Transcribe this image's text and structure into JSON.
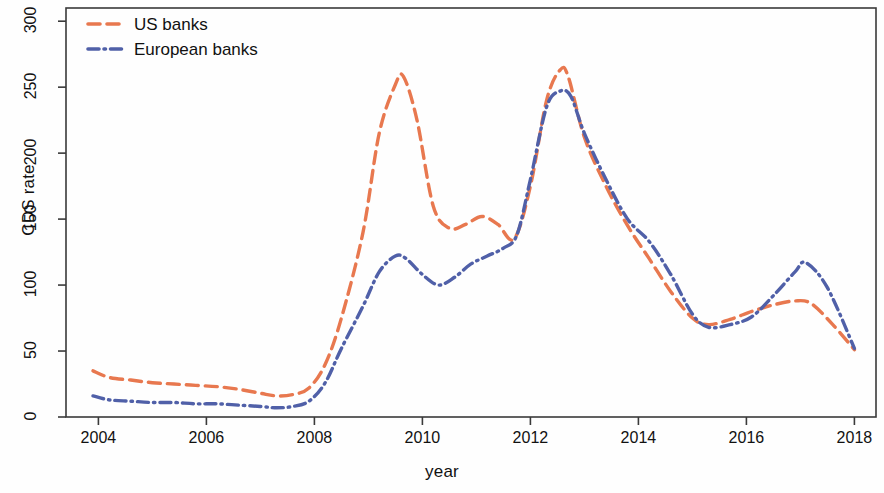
{
  "chart_data": {
    "type": "line",
    "title": "",
    "xlabel": "year",
    "ylabel": "CDS rate",
    "xlim": [
      2003.4,
      2018.4
    ],
    "ylim": [
      0,
      310
    ],
    "xticks": [
      "2004",
      "2006",
      "2008",
      "2010",
      "2012",
      "2014",
      "2016",
      "2018"
    ],
    "xtick_values": [
      2004,
      2006,
      2008,
      2010,
      2012,
      2014,
      2016,
      2018
    ],
    "yticks": [
      "0",
      "50",
      "100",
      "150",
      "200",
      "250",
      "300"
    ],
    "ytick_values": [
      0,
      50,
      100,
      150,
      200,
      250,
      300
    ],
    "grid": false,
    "legend_position": "top-left",
    "series": [
      {
        "name": "US banks",
        "color": "#E8784F",
        "style": "dashed",
        "x": [
          2003.9,
          2004.2,
          2004.6,
          2005.0,
          2005.4,
          2005.8,
          2006.2,
          2006.6,
          2007.0,
          2007.3,
          2007.6,
          2007.9,
          2008.2,
          2008.5,
          2008.9,
          2009.2,
          2009.5,
          2009.65,
          2009.9,
          2010.2,
          2010.5,
          2010.8,
          2011.1,
          2011.4,
          2011.7,
          2012.0,
          2012.3,
          2012.55,
          2012.7,
          2013.0,
          2013.4,
          2013.8,
          2014.2,
          2014.6,
          2015.0,
          2015.3,
          2015.7,
          2016.1,
          2016.5,
          2016.9,
          2017.2,
          2017.6,
          2018.0
        ],
        "y": [
          35,
          30,
          28,
          26,
          25,
          24,
          23,
          21,
          18,
          16,
          17,
          22,
          40,
          75,
          140,
          215,
          252,
          258,
          225,
          160,
          143,
          146,
          152,
          146,
          135,
          175,
          240,
          263,
          258,
          212,
          175,
          145,
          120,
          95,
          75,
          70,
          74,
          80,
          85,
          88,
          86,
          70,
          51
        ]
      },
      {
        "name": "European banks",
        "color": "#5060A8",
        "style": "dash-dot",
        "x": [
          2003.9,
          2004.2,
          2004.6,
          2005.0,
          2005.4,
          2005.8,
          2006.2,
          2006.6,
          2007.0,
          2007.3,
          2007.6,
          2007.9,
          2008.2,
          2008.5,
          2008.9,
          2009.2,
          2009.5,
          2009.7,
          2010.0,
          2010.3,
          2010.6,
          2010.9,
          2011.2,
          2011.5,
          2011.75,
          2012.0,
          2012.3,
          2012.55,
          2012.75,
          2013.0,
          2013.4,
          2013.8,
          2014.2,
          2014.6,
          2015.0,
          2015.3,
          2015.7,
          2016.1,
          2016.5,
          2016.9,
          2017.1,
          2017.5,
          2018.0
        ],
        "y": [
          16,
          13,
          12,
          11,
          11,
          10,
          10,
          9,
          8,
          7,
          8,
          12,
          26,
          52,
          84,
          110,
          122,
          120,
          108,
          100,
          106,
          116,
          122,
          128,
          138,
          180,
          235,
          247,
          243,
          215,
          180,
          150,
          133,
          108,
          78,
          68,
          70,
          76,
          92,
          110,
          117,
          98,
          52
        ]
      }
    ],
    "legend": [
      {
        "label": "US banks",
        "color": "#E8784F",
        "style": "dashed"
      },
      {
        "label": "European banks",
        "color": "#5060A8",
        "style": "dash-dot"
      }
    ]
  },
  "axes": {
    "frame_color": "#3a3a3a"
  }
}
